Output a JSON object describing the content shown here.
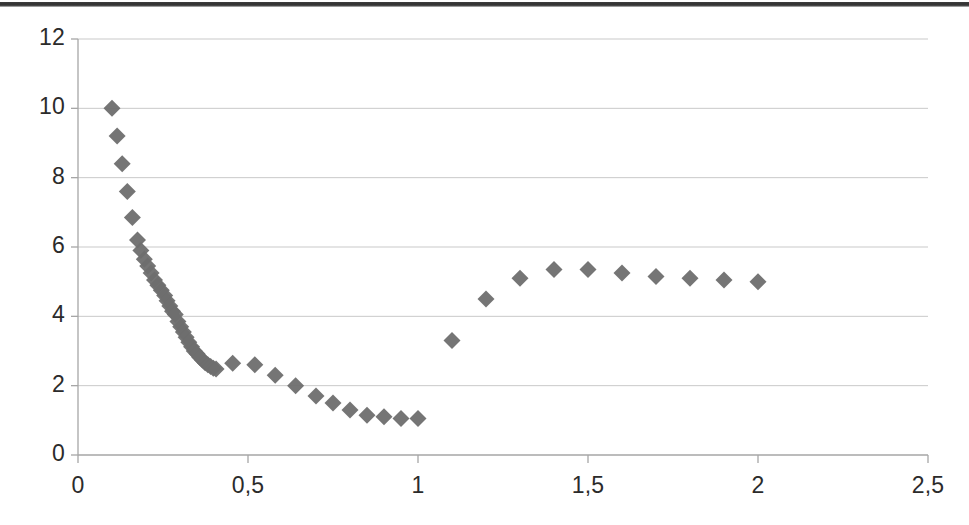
{
  "figure": {
    "title": "",
    "marker_color": "#6e6e6e",
    "gridline_color": "#c9c9c9",
    "axis_color": "#a6a6a6",
    "background_color": "#ffffff",
    "scan_edge_color": "#272727"
  },
  "chart_data": {
    "type": "scatter",
    "title": "",
    "xlabel": "",
    "ylabel": "",
    "xlim": [
      0,
      2.5
    ],
    "ylim": [
      0,
      12
    ],
    "grid": true,
    "legend": null,
    "marker": "diamond",
    "xtick_labels": [
      "0",
      "0,5",
      "1",
      "1,5",
      "2",
      "2,5"
    ],
    "xtick_values": [
      0,
      0.5,
      1,
      1.5,
      2,
      2.5
    ],
    "ytick_labels": [
      "0",
      "2",
      "4",
      "6",
      "8",
      "10",
      "12"
    ],
    "ytick_values": [
      0,
      2,
      4,
      6,
      8,
      10,
      12
    ],
    "decimal_separator": ",",
    "series": [
      {
        "name": "series-1",
        "color": "#6e6e6e",
        "points": [
          [
            0.1,
            10.0
          ],
          [
            0.115,
            9.2
          ],
          [
            0.13,
            8.4
          ],
          [
            0.145,
            7.6
          ],
          [
            0.16,
            6.85
          ],
          [
            0.175,
            6.2
          ],
          [
            0.185,
            5.9
          ],
          [
            0.195,
            5.65
          ],
          [
            0.205,
            5.45
          ],
          [
            0.215,
            5.25
          ],
          [
            0.225,
            5.05
          ],
          [
            0.235,
            4.9
          ],
          [
            0.245,
            4.75
          ],
          [
            0.255,
            4.6
          ],
          [
            0.262,
            4.45
          ],
          [
            0.27,
            4.3
          ],
          [
            0.278,
            4.15
          ],
          [
            0.286,
            4.05
          ],
          [
            0.294,
            3.85
          ],
          [
            0.302,
            3.7
          ],
          [
            0.31,
            3.55
          ],
          [
            0.318,
            3.4
          ],
          [
            0.326,
            3.25
          ],
          [
            0.334,
            3.12
          ],
          [
            0.342,
            3.0
          ],
          [
            0.35,
            2.92
          ],
          [
            0.358,
            2.82
          ],
          [
            0.366,
            2.74
          ],
          [
            0.374,
            2.66
          ],
          [
            0.382,
            2.6
          ],
          [
            0.39,
            2.55
          ],
          [
            0.398,
            2.5
          ],
          [
            0.406,
            2.48
          ],
          [
            0.455,
            2.65
          ],
          [
            0.52,
            2.6
          ],
          [
            0.58,
            2.3
          ],
          [
            0.64,
            2.0
          ],
          [
            0.7,
            1.7
          ],
          [
            0.75,
            1.5
          ],
          [
            0.8,
            1.3
          ],
          [
            0.85,
            1.15
          ],
          [
            0.9,
            1.1
          ],
          [
            0.95,
            1.05
          ],
          [
            1.0,
            1.05
          ],
          [
            1.1,
            3.3
          ],
          [
            1.2,
            4.5
          ],
          [
            1.3,
            5.1
          ],
          [
            1.4,
            5.35
          ],
          [
            1.5,
            5.35
          ],
          [
            1.6,
            5.25
          ],
          [
            1.7,
            5.15
          ],
          [
            1.8,
            5.1
          ],
          [
            1.9,
            5.05
          ],
          [
            2.0,
            5.0
          ]
        ]
      }
    ]
  }
}
